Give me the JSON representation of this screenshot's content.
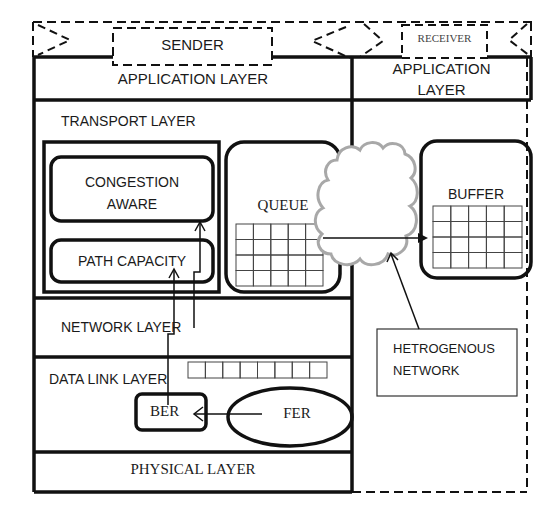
{
  "diagram": {
    "header": {
      "sender_label": "SENDER",
      "receiver_label": "RECEIVER"
    },
    "sender_stack": {
      "application_layer": "APPLICATION LAYER",
      "transport_layer": "TRANSPORT LAYER",
      "congestion_aware_line1": "CONGESTION",
      "congestion_aware_line2": "AWARE",
      "path_capacity": "PATH CAPACITY",
      "queue": "QUEUE",
      "network_layer": "NETWORK LAYER",
      "data_link_layer": "DATA LINK LAYER",
      "ber": "BER",
      "fer": "FER",
      "physical_layer": "PHYSICAL LAYER"
    },
    "receiver_stack": {
      "application_line1": "APPLICATION",
      "application_line2": "LAYER",
      "buffer": "BUFFER"
    },
    "network": {
      "label_line1": "HETROGENOUS",
      "label_line2": "NETWORK"
    },
    "grids": {
      "queue": {
        "cols": 5,
        "rows": 4
      },
      "buffer": {
        "cols": 5,
        "rows": 4
      },
      "data_link_frames": {
        "cols": 8,
        "rows": 1
      }
    },
    "colors": {
      "stroke": "#111111",
      "cloud": "#a8a8a8",
      "background": "#ffffff"
    }
  }
}
